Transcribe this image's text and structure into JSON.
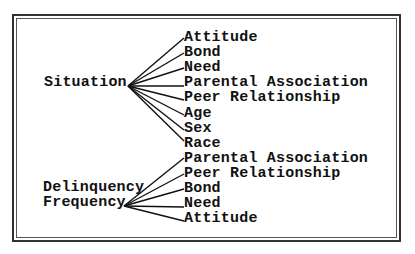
{
  "diagram": {
    "groups": [
      {
        "source": "Situation",
        "targets": [
          "Attitude",
          "Bond",
          "Need",
          "Parental Association",
          "Peer Relationship",
          "Age",
          "Sex",
          "Race"
        ]
      },
      {
        "source_lines": [
          "Delinquency",
          "Frequency"
        ],
        "targets": [
          "Parental Association",
          "Peer Relationship",
          "Bond",
          "Need",
          "Attitude"
        ]
      }
    ]
  }
}
